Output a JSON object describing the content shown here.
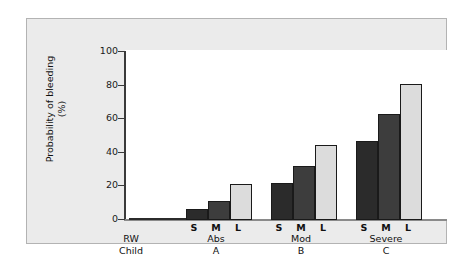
{
  "chart_data": {
    "type": "bar",
    "title": "",
    "subtitle": "",
    "xlabel": "",
    "ylabel": "Probability of bleeding (%)",
    "ylabel_line1": "Probability of bleeding",
    "ylabel_line2": "(%)",
    "ylim": [
      0,
      100
    ],
    "yticks": [
      0,
      20,
      40,
      60,
      80,
      100
    ],
    "ytick_labels": [
      "0",
      "20",
      "40",
      "60",
      "80",
      "100"
    ],
    "grid": false,
    "legend": "none",
    "categories": [
      "RW Child",
      "Abs A",
      "Mod B",
      "Severe C"
    ],
    "group_labels": [
      {
        "name": "RW",
        "code": "Child"
      },
      {
        "name": "Abs",
        "code": "A"
      },
      {
        "name": "Mod",
        "code": "B"
      },
      {
        "name": "Severe",
        "code": "C"
      }
    ],
    "size_labels": [
      "S",
      "M",
      "L"
    ],
    "series": [
      {
        "name": "S",
        "color": "#2b2b2b",
        "values": [
          1,
          6.5,
          21.5,
          46.5
        ]
      },
      {
        "name": "M",
        "color": "#3d3d3d",
        "values": [
          1,
          11,
          32,
          62.5
        ]
      },
      {
        "name": "L",
        "color": "#dcdcdc",
        "values": [
          1,
          21,
          44,
          80
        ]
      }
    ],
    "bars": [
      {
        "group": "RW Child",
        "size": "S",
        "value": 1,
        "color": "#2b2b2b"
      },
      {
        "group": "RW Child",
        "size": "M",
        "value": 1,
        "color": "#3d3d3d"
      },
      {
        "group": "RW Child",
        "size": "L",
        "value": 1,
        "color": "#dcdcdc"
      },
      {
        "group": "Abs A",
        "size": "S",
        "value": 6.5,
        "color": "#2b2b2b"
      },
      {
        "group": "Abs A",
        "size": "M",
        "value": 11,
        "color": "#3d3d3d"
      },
      {
        "group": "Abs A",
        "size": "L",
        "value": 21,
        "color": "#dcdcdc"
      },
      {
        "group": "Mod B",
        "size": "S",
        "value": 21.5,
        "color": "#2b2b2b"
      },
      {
        "group": "Mod B",
        "size": "M",
        "value": 32,
        "color": "#3d3d3d"
      },
      {
        "group": "Mod B",
        "size": "L",
        "value": 44,
        "color": "#dcdcdc"
      },
      {
        "group": "Severe C",
        "size": "S",
        "value": 46.5,
        "color": "#2b2b2b"
      },
      {
        "group": "Severe C",
        "size": "M",
        "value": 62.5,
        "color": "#3d3d3d"
      },
      {
        "group": "Severe C",
        "size": "L",
        "value": 80,
        "color": "#dcdcdc"
      }
    ],
    "colors": {
      "bar_small": "#2b2b2b",
      "bar_medium": "#3d3d3d",
      "bar_large": "#dcdcdc",
      "panel_background": "#ebebeb",
      "plot_background": "#ffffff",
      "axis": "#3a3a3a",
      "border": "#b3b3b3"
    }
  },
  "axis": {
    "ticks": [
      {
        "label": "100",
        "value": 100
      },
      {
        "label": "80",
        "value": 80
      },
      {
        "label": "60",
        "value": 60
      },
      {
        "label": "40",
        "value": 40
      },
      {
        "label": "20",
        "value": 20
      },
      {
        "label": "0",
        "value": 0
      }
    ]
  }
}
